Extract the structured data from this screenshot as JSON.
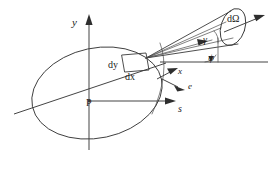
{
  "figure": {
    "background_color": "#ffffff",
    "line_color": "#3a3a3a",
    "text_color": "#1a1a1a",
    "width": 273,
    "height": 170
  },
  "labels": {
    "y_axis": "y",
    "s_axis": "s",
    "x_direction": "x",
    "e_direction": "e",
    "point_p": "P",
    "dy": "dy",
    "dx": "dx",
    "gamma": "γ",
    "psi": "ψ",
    "d_omega": "dΩ"
  },
  "elements": {
    "ellipse_name": "source-region-ellipse",
    "cone_name": "solid-angle-cone",
    "volume_element_name": "volume-element-dx-dy",
    "cone_cap_name": "solid-angle-aperture",
    "reference_line_name": "horizontal-reference-line",
    "slant_line_name": "dx-slant-axis",
    "arc_name": "angle-arc-at-element"
  }
}
